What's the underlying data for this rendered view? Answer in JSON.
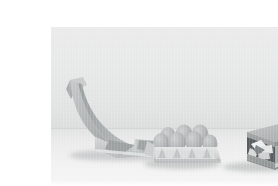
{
  "page": {
    "background_color": "#ffffff"
  },
  "photo": {
    "caption": "Three moulded paper packaging forms arranged on a tabletop against a plain light grey backdrop",
    "frame": {
      "x": 11,
      "y": 11,
      "width": 257,
      "height": 161
    },
    "scene": {
      "backdrop_color": "#e8e9e9",
      "tabletop_color": "#f1f2f2",
      "horizon_y_percent": 62.5,
      "lighting": "soft diffuse from upper left",
      "shadow_color": "#787c7e"
    },
    "objects": [
      {
        "name": "folded-paper-form",
        "label": "Long folded grey paper form with upswept tapering tail",
        "position": "left",
        "material": "grey pressed paper pulp",
        "base_color": "#b9bcbd",
        "highlight_color": "#d6d8d8",
        "shadow_color": "#8d9193"
      },
      {
        "name": "egg-carton-tray",
        "label": "Open egg carton tray holding six eggs",
        "position": "centre",
        "material": "moulded paper pulp tray",
        "base_color": "#d9dbdb",
        "egg_color": "#b6b9b9",
        "egg_count": 6
      },
      {
        "name": "closed-paper-box",
        "label": "Square lidded paper box with white moulded insert visible through the open front",
        "position": "right",
        "material": "grey board box",
        "base_color": "#9fa3a4",
        "lid_color": "#b4b7b8",
        "insert_color": "#f0f1f1"
      }
    ]
  }
}
